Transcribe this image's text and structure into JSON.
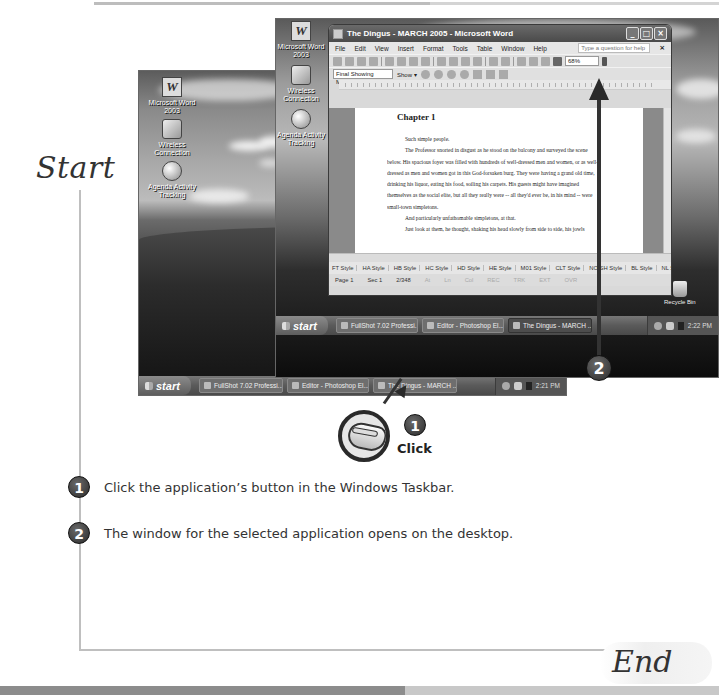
{
  "flow": {
    "start_label": "Start",
    "end_label": "End",
    "click_label": "Click"
  },
  "steps": [
    {
      "number": "1",
      "text": "Click the application’s button in the Windows Taskbar."
    },
    {
      "number": "2",
      "text": "The window for the selected application opens on the desktop."
    }
  ],
  "back_screenshot": {
    "desktop_icons": [
      {
        "label": "Microsoft Word 2003",
        "icon": "word-icon"
      },
      {
        "label": "Wireless Connection",
        "icon": "network-icon"
      },
      {
        "label": "Agenda Activity Tracking",
        "icon": "globe-icon"
      }
    ],
    "taskbar": {
      "start_label": "start",
      "buttons": [
        {
          "label": "FullShot 7.02 Professi...",
          "active": false
        },
        {
          "label": "Editor - Photoshop El...",
          "active": false
        },
        {
          "label": "The Dingus - MARCH ...",
          "active": false
        }
      ],
      "clock": "2:21 PM"
    },
    "recycle_bin_label": "Recycle Bin"
  },
  "front_screenshot": {
    "desktop_icons": [
      {
        "label": "Microsoft Word 2003",
        "icon": "word-icon"
      },
      {
        "label": "Wireless Connection",
        "icon": "network-icon"
      },
      {
        "label": "Agenda Activity Tracking",
        "icon": "globe-icon"
      }
    ],
    "word": {
      "title": "The Dingus - MARCH 2005 - Microsoft Word",
      "menu": [
        "File",
        "Edit",
        "View",
        "Insert",
        "Format",
        "Tools",
        "Table",
        "Window",
        "Help"
      ],
      "help_placeholder": "Type a question for help",
      "zoom": "68%",
      "markup_mode": "Final Showing Markup",
      "show_label": "Show ▾",
      "document": {
        "heading": "Chapter 1",
        "paragraphs": [
          {
            "indent": true,
            "text": "Such simple people."
          },
          {
            "indent": true,
            "text": "The Professor snorted in disgust as he stood on the balcony and surveyed the scene"
          },
          {
            "indent": false,
            "text": "below. His spacious foyer was filled with hundreds of well-dressed men and women, or as well-"
          },
          {
            "indent": false,
            "text": "dressed as men and women got in this God-forsaken burg. They were having a grand old time,"
          },
          {
            "indent": false,
            "text": "drinking his liquor, eating his food, soiling his carpets. His guests might have imagined"
          },
          {
            "indent": false,
            "text": "themselves as the social elite, but all they really were -- all they'd ever be, in his mind -- were"
          },
          {
            "indent": false,
            "text": "small-town simpletons."
          },
          {
            "indent": true,
            "text": "And particularly unfathomable simpletons, at that."
          },
          {
            "indent": true,
            "text": "Just look at them, he thought, shaking his head slowly from side to side, his jowls"
          }
        ]
      },
      "styles": [
        "FT Style",
        "HA Style",
        "HB Style",
        "HC Style",
        "HD Style",
        "HE Style",
        "M01 Style",
        "CLT Style",
        "NO SH Style",
        "BL Style",
        "NL Style"
      ],
      "status": {
        "page": "Page 1",
        "sec": "Sec 1",
        "pages": "2/348",
        "at": "At",
        "ln": "Ln",
        "col": "Col",
        "rec": "REC",
        "trk": "TRK",
        "ext": "EXT",
        "ovr": "OVR"
      }
    },
    "taskbar": {
      "start_label": "start",
      "buttons": [
        {
          "label": "FullShot 7.02 Professi...",
          "active": false
        },
        {
          "label": "Editor - Photoshop El...",
          "active": false
        },
        {
          "label": "The Dingus - MARCH ...",
          "active": true
        }
      ],
      "clock": "2:22 PM"
    },
    "recycle_bin_label": "Recycle Bin"
  }
}
